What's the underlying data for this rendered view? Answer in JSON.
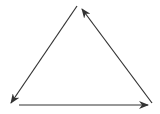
{
  "diagram": {
    "type": "cycle-triangle",
    "background": "#ffffff",
    "stroke_color": "#333333",
    "stroke_width": 1.2,
    "arrows": [
      {
        "name": "left-arrow",
        "from": [
          77,
          6
        ],
        "to": [
          11,
          103
        ],
        "direction": "top-to-bottom-left"
      },
      {
        "name": "bottom-arrow",
        "from": [
          19,
          105
        ],
        "to": [
          148,
          105
        ],
        "direction": "left-to-right"
      },
      {
        "name": "right-arrow",
        "from": [
          152,
          103
        ],
        "to": [
          82,
          9
        ],
        "direction": "bottom-right-to-top"
      }
    ],
    "labels": []
  }
}
